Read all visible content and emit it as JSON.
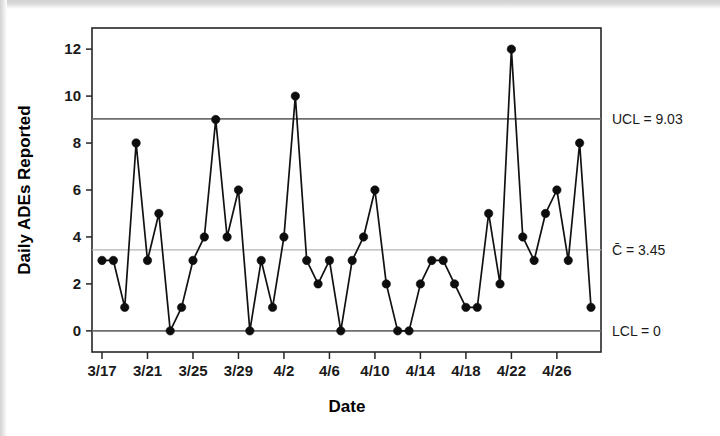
{
  "chart_data": {
    "type": "line",
    "title": "",
    "xlabel": "Date",
    "ylabel": "Daily ADEs Reported",
    "x": [
      "3/17",
      "3/18",
      "3/19",
      "3/20",
      "3/21",
      "3/22",
      "3/23",
      "3/24",
      "3/25",
      "3/26",
      "3/27",
      "3/28",
      "3/29",
      "3/30",
      "3/31",
      "4/1",
      "4/2",
      "4/3",
      "4/4",
      "4/5",
      "4/6",
      "4/7",
      "4/8",
      "4/9",
      "4/10",
      "4/11",
      "4/12",
      "4/13",
      "4/14",
      "4/15",
      "4/16",
      "4/17",
      "4/18",
      "4/19",
      "4/20",
      "4/21",
      "4/22",
      "4/23",
      "4/24",
      "4/25",
      "4/26",
      "4/27",
      "4/28",
      "4/29"
    ],
    "values": [
      3,
      3,
      1,
      8,
      3,
      5,
      0,
      1,
      3,
      4,
      9,
      4,
      6,
      0,
      3,
      1,
      4,
      10,
      3,
      2,
      3,
      0,
      3,
      4,
      6,
      2,
      0,
      0,
      2,
      3,
      3,
      2,
      1,
      1,
      5,
      2,
      12,
      4,
      3,
      5,
      6,
      3,
      8,
      1
    ],
    "xtick_labels": [
      "3/17",
      "3/21",
      "3/25",
      "3/29",
      "4/2",
      "4/6",
      "4/10",
      "4/14",
      "4/18",
      "4/22",
      "4/26"
    ],
    "xtick_indices": [
      0,
      4,
      8,
      12,
      16,
      20,
      24,
      28,
      32,
      36,
      40
    ],
    "ytick_labels": [
      "0",
      "2",
      "4",
      "6",
      "8",
      "10",
      "12"
    ],
    "ytick_values": [
      0,
      2,
      4,
      6,
      8,
      10,
      12
    ],
    "ylim": [
      -0.9,
      12.9
    ],
    "grid": false,
    "legend_position": "right-outside",
    "control_limits": {
      "ucl_label": "UCL = 9.03",
      "ucl_value": 9.03,
      "center_label": "C̄ = 3.45",
      "center_value": 3.45,
      "lcl_label": "LCL = 0",
      "lcl_value": 0
    },
    "colors": {
      "series": "#0d0d0d",
      "limit_line": "#6e6e6e",
      "center_line": "#b4b4b4",
      "frame": "#262626",
      "text": "#1a1a1a",
      "background": "#ffffff"
    }
  }
}
